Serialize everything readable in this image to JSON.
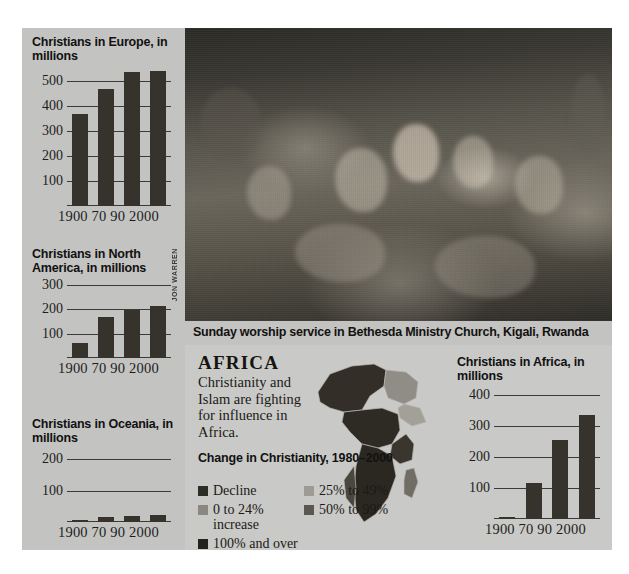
{
  "meta": {
    "photo_caption": "Sunday worship service in Bethesda Ministry Church, Kigali, Rwanda",
    "photo_credit": "JON WARREN"
  },
  "africa_block": {
    "heading": "AFRICA",
    "body": "Christianity and Islam are fighting for influence in Africa.",
    "legend_title": "Change in Christianity, 1980–2000",
    "legend_items": [
      {
        "label": "Decline",
        "color": "#2e2c26"
      },
      {
        "label": "0 to 24% increase",
        "color": "#8a8880"
      },
      {
        "label": "25% to 49%",
        "color": "#9d9b93"
      },
      {
        "label": "50% to 99%",
        "color": "#5a5850"
      },
      {
        "label": "100% and over",
        "color": "#24221d"
      }
    ]
  },
  "chart_data": [
    {
      "id": "europe",
      "type": "bar",
      "title": "Christians in Europe, in millions",
      "categories": [
        "1900",
        "70",
        "90",
        "2000"
      ],
      "values": [
        368,
        467,
        537,
        540
      ],
      "yticks": [
        100,
        200,
        300,
        400,
        500
      ],
      "ylim": [
        0,
        560
      ],
      "xlabel": "",
      "ylabel": "millions",
      "grid": true
    },
    {
      "id": "north-america",
      "type": "bar",
      "title": "Christians in North America, in millions",
      "categories": [
        "1900",
        "70",
        "90",
        "2000"
      ],
      "values": [
        60,
        170,
        196,
        212
      ],
      "yticks": [
        100,
        200,
        300
      ],
      "ylim": [
        0,
        320
      ],
      "xlabel": "",
      "ylabel": "millions",
      "grid": true
    },
    {
      "id": "oceania",
      "type": "bar",
      "title": "Christians in Oceania, in millions",
      "categories": [
        "1900",
        "70",
        "90",
        "2000"
      ],
      "values": [
        5,
        15,
        20,
        24
      ],
      "yticks": [
        100,
        200
      ],
      "ylim": [
        0,
        230
      ],
      "xlabel": "",
      "ylabel": "millions",
      "grid": true
    },
    {
      "id": "africa",
      "type": "bar",
      "title": "Christians in Africa, in millions",
      "categories": [
        "1900",
        "70",
        "90",
        "2000"
      ],
      "values": [
        8,
        115,
        255,
        335
      ],
      "yticks": [
        100,
        200,
        300,
        400
      ],
      "ylim": [
        0,
        430
      ],
      "xlabel": "",
      "ylabel": "millions",
      "grid": true
    }
  ]
}
